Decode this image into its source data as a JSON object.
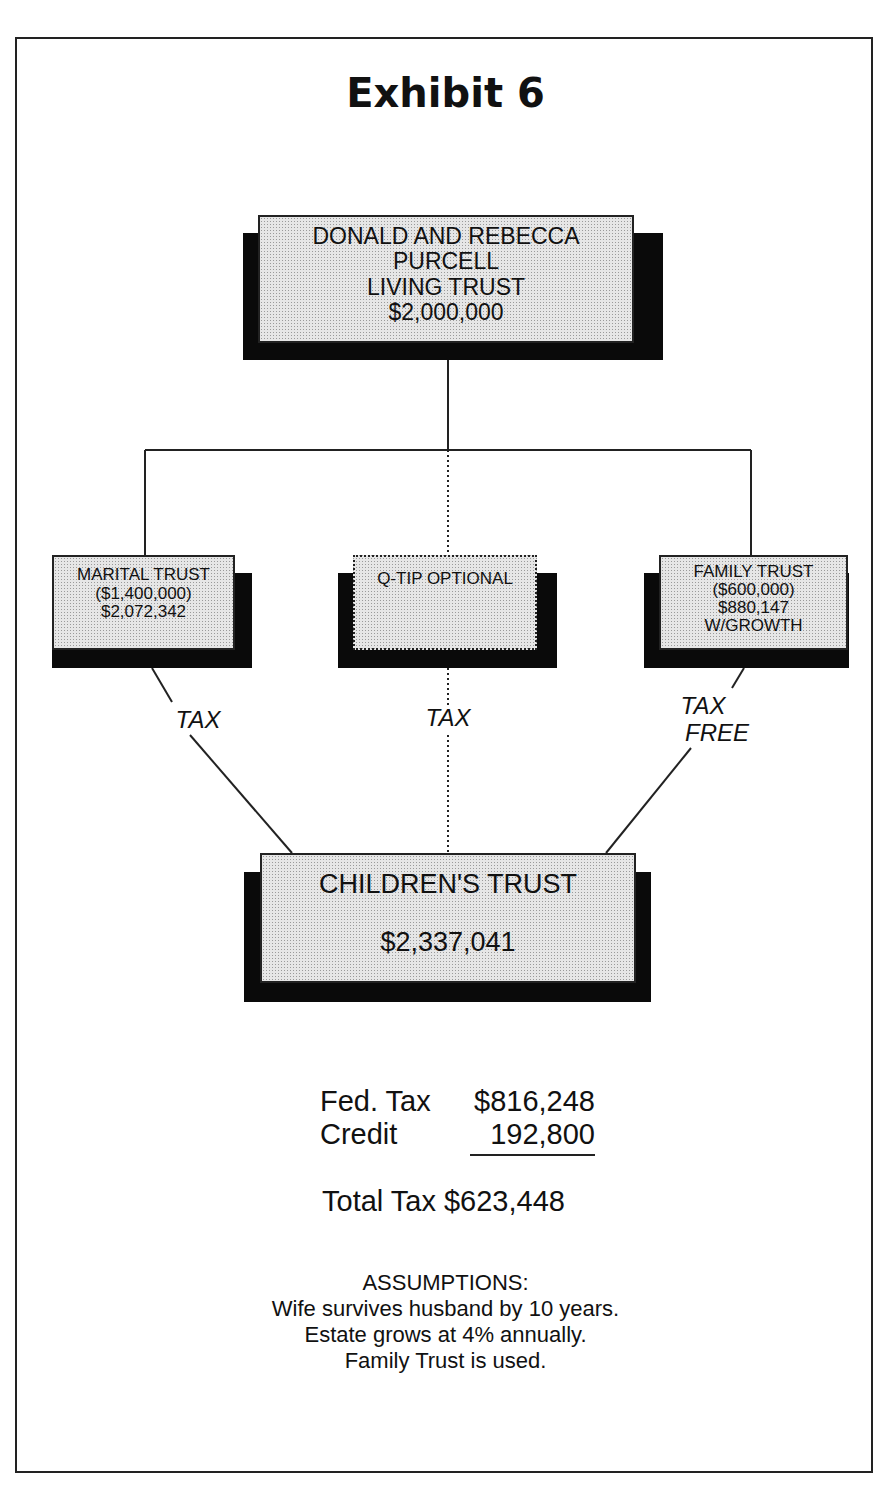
{
  "title": "Exhibit 6",
  "nodes": {
    "living_trust": {
      "lines": [
        "DONALD AND REBECCA",
        "PURCELL",
        "LIVING TRUST",
        "$2,000,000"
      ]
    },
    "marital_trust": {
      "lines": [
        "MARITAL TRUST",
        "($1,400,000)",
        "$2,072,342"
      ]
    },
    "qtip": {
      "lines": [
        "Q-TIP OPTIONAL"
      ]
    },
    "family_trust": {
      "lines": [
        "FAMILY TRUST",
        "($600,000)",
        "$880,147",
        "W/GROWTH"
      ]
    },
    "childrens_trust": {
      "lines": [
        "CHILDREN'S TRUST",
        "$2,337,041"
      ]
    }
  },
  "edge_labels": {
    "marital": "TAX",
    "qtip": "TAX",
    "family_1": "TAX",
    "family_2": "FREE"
  },
  "tax_summary": {
    "rows": [
      {
        "label": "Fed. Tax",
        "value": "$816,248"
      },
      {
        "label": "Credit",
        "value": "192,800"
      }
    ],
    "total_label": "Total Tax",
    "total_value": "$623,448"
  },
  "assumptions": {
    "heading": "ASSUMPTIONS:",
    "items": [
      "Wife survives husband by 10 years.",
      "Estate grows at 4% annually.",
      "Family Trust is used."
    ]
  }
}
